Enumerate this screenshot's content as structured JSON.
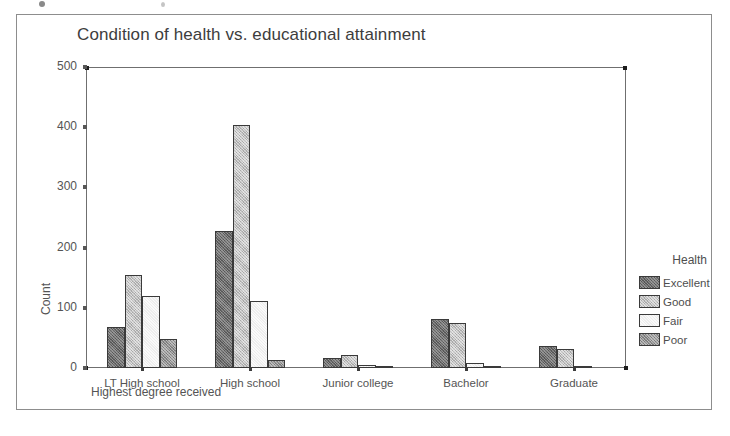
{
  "figure": {
    "title": "Condition of health vs. educational attainment",
    "xlabel": "Highest degree received",
    "ylabel": "Count",
    "legend_title": "Health"
  },
  "chart_data": {
    "type": "bar",
    "title": "Condition of health vs. educational attainment",
    "xlabel": "Highest degree received",
    "ylabel": "Count",
    "categories": [
      "LT High school",
      "High school",
      "Junior college",
      "Bachelor",
      "Graduate"
    ],
    "series": [
      {
        "name": "Excellent",
        "color": "#6a6a6a",
        "values": [
          68,
          227,
          16,
          81,
          36
        ]
      },
      {
        "name": "Good",
        "color": "#c0c0c0",
        "values": [
          155,
          403,
          22,
          75,
          31
        ]
      },
      {
        "name": "Fair",
        "color": "#ededed",
        "values": [
          120,
          111,
          5,
          8,
          3
        ]
      },
      {
        "name": "Poor",
        "color": "#909090",
        "values": [
          48,
          13,
          1,
          2,
          0
        ]
      }
    ],
    "ylim": [
      0,
      500
    ],
    "yticks": [
      0,
      100,
      200,
      300,
      400,
      500
    ],
    "ytick_labels": [
      "0",
      "100",
      "200",
      "300",
      "400",
      "500"
    ],
    "grid": false,
    "legend_position": "right"
  }
}
